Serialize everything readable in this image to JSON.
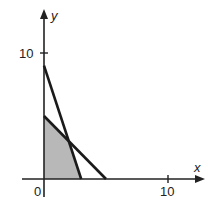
{
  "chart_data": {
    "type": "line",
    "title": "",
    "xlabel": "x",
    "ylabel": "y",
    "xlim": [
      -2.5,
      12.8
    ],
    "ylim": [
      -1.5,
      13.5
    ],
    "grid": false,
    "legend": null,
    "x_ticks": [
      {
        "value": 0,
        "label": "0"
      },
      {
        "value": 10,
        "label": "10"
      }
    ],
    "y_ticks": [
      {
        "value": 10,
        "label": "10"
      }
    ],
    "series": [
      {
        "name": "line-1",
        "equation": "3x + y = 9",
        "points": [
          [
            0,
            9
          ],
          [
            3,
            0
          ]
        ]
      },
      {
        "name": "line-2",
        "equation": "x + y = 5",
        "points": [
          [
            0,
            5
          ],
          [
            5,
            0
          ]
        ]
      }
    ],
    "shaded_region": {
      "description": "feasible region",
      "vertices": [
        [
          0,
          0
        ],
        [
          0,
          5
        ],
        [
          2,
          3
        ],
        [
          3,
          0
        ]
      ],
      "color": "#b8b8b8"
    }
  },
  "labels": {
    "x_axis": "x",
    "y_axis": "y",
    "origin": "0",
    "x_tick_10": "10",
    "y_tick_10": "10"
  },
  "colors": {
    "axis": "#222222",
    "line": "#1a1a1a",
    "shade": "#b8b8b8"
  }
}
